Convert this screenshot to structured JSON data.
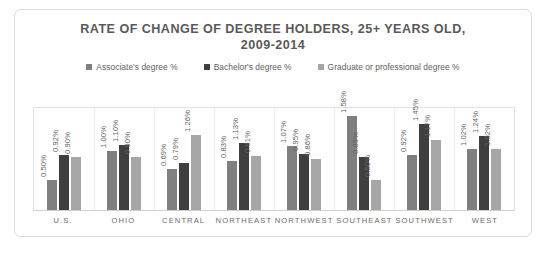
{
  "chart_data": {
    "type": "bar",
    "title": "RATE OF CHANGE OF DEGREE HOLDERS, 25+ YEARS OLD, 2009-2014",
    "title_lines": [
      "RATE OF CHANGE OF DEGREE HOLDERS, 25+ YEARS OLD,",
      "2009-2014"
    ],
    "xlabel": "",
    "ylabel": "",
    "ylim": [
      0,
      1.75
    ],
    "grid": false,
    "legend_position": "top",
    "value_labels": true,
    "value_label_rotation": -90,
    "categories": [
      "U.S.",
      "OHIO",
      "CENTRAL",
      "NORTHEAST",
      "NORTHWEST",
      "SOUTHEAST",
      "SOUTHWEST",
      "WEST"
    ],
    "series": [
      {
        "name": "Associate's degree %",
        "color": "#808080",
        "values": [
          0.5,
          1.0,
          0.69,
          0.83,
          1.07,
          1.58,
          0.92,
          1.02
        ],
        "labels": [
          "0.50%",
          "1.00%",
          "0.69%",
          "0.83%",
          "1.07%",
          "1.58%",
          "0.92%",
          "1.02%"
        ]
      },
      {
        "name": "Bachelor's degree %",
        "color": "#3f3f3f",
        "values": [
          0.92,
          1.1,
          0.79,
          1.13,
          0.95,
          0.89,
          1.45,
          1.24
        ],
        "labels": [
          "0.92%",
          "1.10%",
          "0.79%",
          "1.13%",
          "0.95%",
          "0.89%",
          "1.45%",
          "1.24%"
        ]
      },
      {
        "name": "Graduate or professional degree %",
        "color": "#a6a6a6",
        "values": [
          0.9,
          0.9,
          1.26,
          0.91,
          0.86,
          0.5,
          1.17,
          1.02
        ],
        "labels": [
          "0.90%",
          "0.90%",
          "1.26%",
          "0.91%",
          "0.86%",
          "0.50%",
          "1.17%",
          "1.02%"
        ]
      }
    ]
  }
}
